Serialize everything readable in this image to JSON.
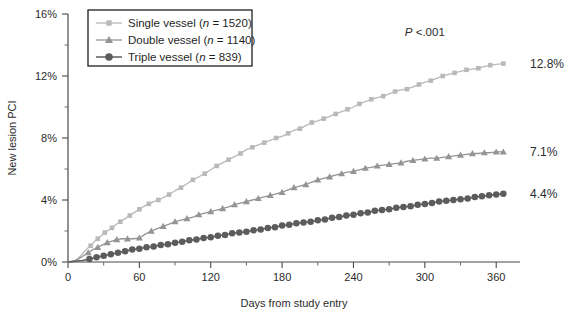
{
  "chart_data": {
    "type": "line",
    "title": "",
    "xlabel": "Days from study entry",
    "ylabel": "New lesion PCI",
    "xlim": [
      0,
      380
    ],
    "ylim": [
      0,
      16
    ],
    "grid": false,
    "xticks": [
      0,
      60,
      120,
      180,
      240,
      300,
      360
    ],
    "xtick_labels": [
      "0",
      "60",
      "120",
      "180",
      "240",
      "300",
      "360"
    ],
    "xticks_minor": [
      30,
      90,
      150,
      210,
      270,
      330
    ],
    "yticks": [
      0,
      4,
      8,
      12,
      16
    ],
    "ytick_labels": [
      "0%",
      "4%",
      "8%",
      "12%",
      "16%"
    ],
    "yticks_minor": [
      2,
      6,
      10,
      14
    ],
    "legend_position": "top-left",
    "annotations": [
      {
        "name": "p-value",
        "text_prefix": "P",
        "text_rest": " <.001",
        "x": 300,
        "y": 14.6
      },
      {
        "name": "endpoint-single",
        "text": "12.8%",
        "x": 378,
        "y": 12.8
      },
      {
        "name": "endpoint-double",
        "text": "7.1%",
        "x": 378,
        "y": 7.1
      },
      {
        "name": "endpoint-triple",
        "text": "4.4%",
        "x": 378,
        "y": 4.4
      }
    ],
    "series": [
      {
        "name": "Single vessel",
        "legend_label": "Single vessel (n = 1520)",
        "label_main": "Single vessel (",
        "label_italic": "n",
        "label_tail": " = 1520)",
        "n": 1520,
        "marker": "square",
        "color": "#b9b9b9",
        "final_value": 12.8,
        "x": [
          0,
          4,
          7,
          10,
          13,
          16,
          19,
          22,
          25,
          28,
          31,
          34,
          37,
          40,
          44,
          48,
          52,
          56,
          60,
          64,
          68,
          72,
          76,
          80,
          85,
          90,
          95,
          100,
          105,
          110,
          115,
          120,
          125,
          130,
          135,
          140,
          145,
          150,
          155,
          160,
          165,
          170,
          175,
          180,
          185,
          190,
          195,
          200,
          205,
          210,
          215,
          220,
          225,
          230,
          235,
          240,
          245,
          250,
          255,
          260,
          265,
          270,
          275,
          280,
          285,
          290,
          295,
          300,
          305,
          310,
          315,
          320,
          325,
          330,
          335,
          340,
          345,
          350,
          355,
          360,
          366
        ],
        "y": [
          0,
          0.05,
          0.15,
          0.35,
          0.6,
          0.85,
          1.05,
          1.3,
          1.5,
          1.7,
          1.9,
          2.05,
          2.2,
          2.4,
          2.6,
          2.8,
          3.0,
          3.2,
          3.4,
          3.6,
          3.75,
          3.9,
          4.0,
          4.15,
          4.35,
          4.6,
          4.8,
          5.05,
          5.3,
          5.5,
          5.7,
          5.95,
          6.2,
          6.4,
          6.6,
          6.8,
          7.0,
          7.25,
          7.4,
          7.55,
          7.7,
          7.85,
          8.0,
          8.1,
          8.3,
          8.5,
          8.6,
          8.8,
          9.0,
          9.1,
          9.25,
          9.4,
          9.55,
          9.7,
          9.85,
          10.0,
          10.2,
          10.35,
          10.5,
          10.6,
          10.7,
          10.85,
          11.0,
          11.1,
          11.15,
          11.3,
          11.45,
          11.6,
          11.7,
          11.85,
          12.0,
          12.1,
          12.2,
          12.3,
          12.4,
          12.45,
          12.5,
          12.6,
          12.7,
          12.75,
          12.8
        ]
      },
      {
        "name": "Double vessel",
        "legend_label": "Double vessel (n = 1140)",
        "label_main": "Double vessel (",
        "label_italic": "n",
        "label_tail": " = 1140)",
        "n": 1140,
        "marker": "triangle",
        "color": "#949494",
        "final_value": 7.1,
        "x": [
          0,
          5,
          9,
          13,
          17,
          21,
          25,
          29,
          33,
          37,
          41,
          45,
          50,
          55,
          60,
          65,
          70,
          75,
          80,
          85,
          90,
          95,
          100,
          105,
          110,
          115,
          120,
          125,
          130,
          135,
          140,
          145,
          150,
          155,
          160,
          165,
          170,
          175,
          180,
          185,
          190,
          195,
          200,
          205,
          210,
          215,
          220,
          225,
          230,
          235,
          240,
          245,
          250,
          255,
          260,
          265,
          270,
          275,
          280,
          285,
          290,
          295,
          300,
          305,
          310,
          315,
          320,
          325,
          330,
          335,
          340,
          345,
          350,
          355,
          360,
          366
        ],
        "y": [
          0,
          0.05,
          0.2,
          0.4,
          0.6,
          0.8,
          0.95,
          1.1,
          1.25,
          1.35,
          1.45,
          1.5,
          1.5,
          1.5,
          1.55,
          1.8,
          2.0,
          2.15,
          2.3,
          2.45,
          2.6,
          2.7,
          2.8,
          2.9,
          3.05,
          3.15,
          3.25,
          3.35,
          3.45,
          3.55,
          3.7,
          3.8,
          3.9,
          4.0,
          4.1,
          4.2,
          4.3,
          4.4,
          4.5,
          4.65,
          4.8,
          4.9,
          5.0,
          5.15,
          5.3,
          5.4,
          5.5,
          5.6,
          5.7,
          5.8,
          5.85,
          5.95,
          6.05,
          6.1,
          6.2,
          6.25,
          6.3,
          6.35,
          6.4,
          6.5,
          6.55,
          6.6,
          6.65,
          6.7,
          6.7,
          6.75,
          6.8,
          6.85,
          6.9,
          6.95,
          7.0,
          7.0,
          7.05,
          7.05,
          7.1,
          7.1
        ]
      },
      {
        "name": "Triple vessel",
        "legend_label": "Triple vessel (n = 839)",
        "label_main": "Triple vessel (",
        "label_italic": "n",
        "label_tail": " = 839)",
        "n": 839,
        "marker": "circle",
        "color": "#5c5c5c",
        "final_value": 4.4,
        "x": [
          0,
          6,
          12,
          18,
          24,
          30,
          36,
          42,
          48,
          54,
          60,
          66,
          72,
          78,
          84,
          90,
          96,
          102,
          108,
          114,
          120,
          126,
          132,
          138,
          144,
          150,
          156,
          162,
          168,
          174,
          180,
          186,
          192,
          198,
          204,
          210,
          216,
          222,
          228,
          234,
          240,
          246,
          252,
          258,
          264,
          270,
          276,
          282,
          288,
          294,
          300,
          306,
          312,
          318,
          324,
          330,
          336,
          342,
          348,
          354,
          360,
          366
        ],
        "y": [
          0,
          0.05,
          0.1,
          0.2,
          0.3,
          0.4,
          0.5,
          0.6,
          0.7,
          0.8,
          0.85,
          0.95,
          1.0,
          1.1,
          1.15,
          1.25,
          1.3,
          1.4,
          1.45,
          1.55,
          1.6,
          1.7,
          1.75,
          1.85,
          1.9,
          1.95,
          2.05,
          2.1,
          2.2,
          2.25,
          2.35,
          2.4,
          2.5,
          2.55,
          2.6,
          2.7,
          2.75,
          2.85,
          2.9,
          3.0,
          3.05,
          3.15,
          3.2,
          3.3,
          3.35,
          3.4,
          3.5,
          3.55,
          3.6,
          3.7,
          3.75,
          3.8,
          3.9,
          3.95,
          4.0,
          4.05,
          4.1,
          4.2,
          4.25,
          4.3,
          4.35,
          4.4
        ]
      }
    ]
  }
}
